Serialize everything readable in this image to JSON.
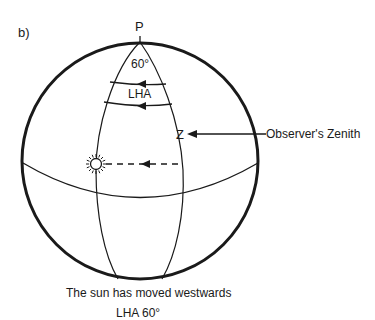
{
  "figure": {
    "label": "b)",
    "pole_label": "P",
    "angle_label": "60°",
    "lha_label": "LHA",
    "zenith_label": "Z",
    "zenith_annotation": "Observer's Zenith",
    "caption_line1": "The sun has moved westwards",
    "caption_line2": "LHA 60°",
    "sun_icon": "sun-icon",
    "colors": {
      "stroke": "#1a1a1a",
      "background": "#ffffff"
    }
  }
}
